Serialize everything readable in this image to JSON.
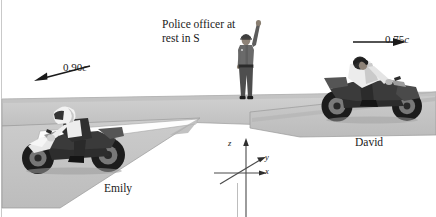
{
  "figure": {
    "type": "physics-relativity-illustration",
    "width": 436,
    "height": 217,
    "background_color": "#ffffff"
  },
  "labels": {
    "officer": "Police officer at\nrest in S",
    "officer_line1": "Police officer at",
    "officer_line2": "rest in S",
    "emily": "Emily",
    "david": "David"
  },
  "velocities": {
    "left": {
      "magnitude": "0.90",
      "unit": "c",
      "full": "0.90c",
      "direction": "left",
      "belongs_to": "Emily"
    },
    "right": {
      "magnitude": "0.75",
      "unit": "c",
      "full": "0.75c",
      "direction": "right",
      "belongs_to": "David"
    }
  },
  "axes": {
    "frame_name": "S",
    "z_label": "z",
    "y_label": "y",
    "x_label": "x",
    "origin_x": 246,
    "origin_y": 172
  },
  "figures": [
    {
      "name": "police-officer",
      "pose": "standing, right arm raised",
      "facing": "viewer"
    },
    {
      "name": "emily-motorcycle",
      "pose": "riding sportbike",
      "facing": "left"
    },
    {
      "name": "david-motorcycle",
      "pose": "riding sportbike",
      "facing": "right"
    }
  ],
  "colors": {
    "road": "#c6c6c6",
    "road_shadow": "#b0b0b0",
    "road_edge": "#8f8f8f",
    "text": "#1a1a1a",
    "arrow": "#1a1a1a",
    "frame_rule": "#c9c9c9"
  }
}
